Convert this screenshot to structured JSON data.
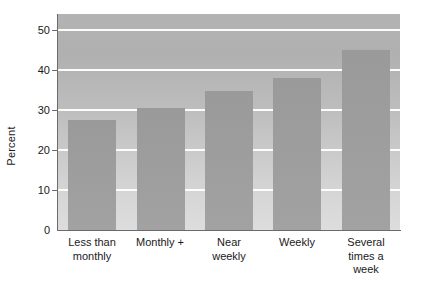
{
  "chart_data": {
    "type": "bar",
    "title": "",
    "xlabel": "",
    "ylabel": "Percent",
    "categories": [
      "Less than\nmonthly",
      "Monthly +",
      "Near\nweekly",
      "Weekly",
      "Several\ntimes a\nweek"
    ],
    "values": [
      27.5,
      30.5,
      34.8,
      38.0,
      45.0
    ],
    "ylim": [
      0,
      54
    ],
    "yticks": [
      0,
      10,
      20,
      30,
      40,
      50
    ],
    "ytick_labels": [
      "0",
      "10",
      "20",
      "30",
      "40",
      "50"
    ],
    "grid": true,
    "grid_axis": "y",
    "legend": "none",
    "bar_color": "#9d9d9d",
    "plot_background": "#bdbdbd",
    "gridline_color": "#fdfdfd",
    "axis_color": "#6b6b6b",
    "text_color": "#1a1a1a"
  },
  "axis": {
    "y_title": "Percent"
  },
  "x_labels": [
    {
      "lines": [
        "Less than",
        "monthly"
      ]
    },
    {
      "lines": [
        "Monthly +"
      ]
    },
    {
      "lines": [
        "Near",
        "weekly"
      ]
    },
    {
      "lines": [
        "Weekly"
      ]
    },
    {
      "lines": [
        "Several",
        "times a",
        "week"
      ]
    }
  ]
}
